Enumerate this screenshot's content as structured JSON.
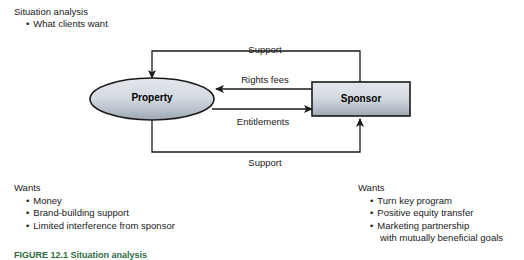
{
  "header": {
    "title": "Situation analysis",
    "bullet": "What clients want"
  },
  "diagram": {
    "nodes": {
      "property": "Property",
      "sponsor": "Sponsor"
    },
    "edges": {
      "support_top": "Support",
      "rights_fees": "Rights fees",
      "entitlements": "Entitlements",
      "support_bottom": "Support"
    },
    "colors": {
      "node_fill_light": "#dfe3e9",
      "node_fill_dark": "#9ca8b4",
      "node_stroke": "#1a1a1a",
      "edge_stroke": "#1a1a1a"
    }
  },
  "wants_left": {
    "title": "Wants",
    "items": [
      "Money",
      "Brand-building support",
      "Limited interference from sponsor"
    ]
  },
  "wants_right": {
    "title": "Wants",
    "items": [
      "Turn key program",
      "Positive equity transfer",
      "Marketing partnership"
    ],
    "continuation": "with mutually beneficial goals"
  },
  "caption": {
    "text": "FIGURE 12.1  Situation analysis"
  },
  "bullet_glyph": "•"
}
